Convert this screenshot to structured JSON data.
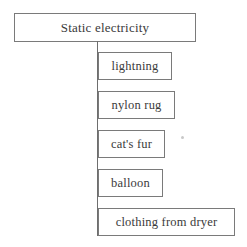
{
  "diagram": {
    "type": "tree",
    "root": {
      "label": "Static electricity"
    },
    "children": [
      {
        "label": "lightning"
      },
      {
        "label": "nylon rug"
      },
      {
        "label": "cat's fur"
      },
      {
        "label": "balloon"
      },
      {
        "label": "clothing from dryer"
      }
    ],
    "colors": {
      "border": "#7a7a7a",
      "text": "#3a3a3a",
      "background": "#ffffff"
    }
  }
}
